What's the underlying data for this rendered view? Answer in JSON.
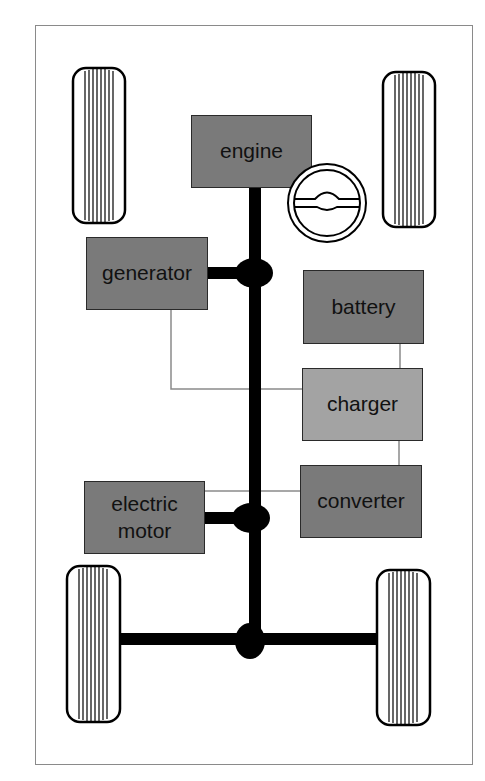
{
  "diagram": {
    "title": "",
    "components": [
      {
        "id": "engine",
        "label": "engine",
        "shade": "dark"
      },
      {
        "id": "generator",
        "label": "generator",
        "shade": "dark"
      },
      {
        "id": "battery",
        "label": "battery",
        "shade": "dark"
      },
      {
        "id": "charger",
        "label": "charger",
        "shade": "light"
      },
      {
        "id": "converter",
        "label": "converter",
        "shade": "dark"
      },
      {
        "id": "electric_motor",
        "label_line1": "electric",
        "label_line2": "motor",
        "shade": "dark"
      }
    ],
    "mechanical_links": [
      [
        "engine",
        "generator"
      ],
      [
        "generator",
        "electric_motor"
      ],
      [
        "electric_motor",
        "rear_axle"
      ]
    ],
    "electrical_links": [
      [
        "generator",
        "charger"
      ],
      [
        "battery",
        "charger"
      ],
      [
        "charger",
        "converter"
      ],
      [
        "converter",
        "electric_motor"
      ]
    ],
    "icons": [
      "steering-wheel",
      "tire-front-left",
      "tire-front-right",
      "tire-rear-left",
      "tire-rear-right"
    ],
    "colors": {
      "dark_box": "#7a7a7a",
      "light_box": "#a3a3a3",
      "shaft": "#000000",
      "wire": "#8a8a8a",
      "frame": "#8a8a8a"
    }
  }
}
